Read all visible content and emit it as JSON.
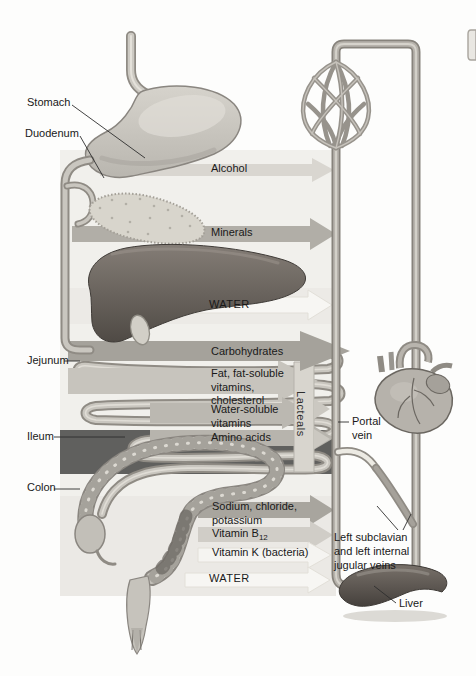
{
  "figure": {
    "side_labels": {
      "stomach": "Stomach",
      "duodenum": "Duodenum",
      "jejunum": "Jejunum",
      "ileum": "Ileum",
      "colon": "Colon"
    },
    "absorption_labels": {
      "alcohol": "Alcohol",
      "minerals": "Minerals",
      "water_upper": "WATER",
      "carbohydrates": "Carbohydrates",
      "fat": "Fat, fat-soluble\nvitamins,\ncholesterol",
      "water_soluble": "Water-soluble\nvitamins",
      "amino_acids": "Amino acids",
      "sodium": "Sodium, chloride,\npotassium",
      "vitamin_b12_text": "Vitamin B",
      "vitamin_b12_sub": "12",
      "vitamin_k": "Vitamin K (bacteria)",
      "water_lower": "WATER"
    },
    "vessel_labels": {
      "lacteals": "Lacteals",
      "portal_vein": "Portal\nvein",
      "subclavian": "Left subclavian\nand left internal\njugular veins",
      "liver": "Liver"
    },
    "palette": {
      "panel": "#f1f0ec",
      "arrow_light": "#d9d6d0",
      "arrow_medium": "#b1aea7",
      "arrow_dark": "#a5a29b",
      "arrow_white": "#f7f6f3",
      "vessel_outline": "#87837c",
      "vessel_fill": "#b7b3ac",
      "liver_dark": "#4f4a45",
      "text": "#191919"
    }
  }
}
